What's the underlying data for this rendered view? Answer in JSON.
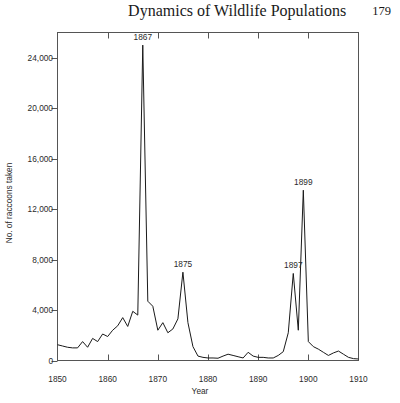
{
  "header": {
    "title": "Dynamics of Wildlife Populations",
    "page_number": "179"
  },
  "chart_data": {
    "type": "line",
    "title": "",
    "xlabel": "Year",
    "ylabel": "No. of raccoons taken",
    "xlim": [
      1850,
      1910
    ],
    "ylim": [
      0,
      26000
    ],
    "grid": false,
    "legend": null,
    "x_ticks": [
      "1850",
      "1860",
      "1870",
      "1880",
      "1890",
      "1900",
      "1910"
    ],
    "x_tick_values": [
      1850,
      1860,
      1870,
      1880,
      1890,
      1900,
      1910
    ],
    "y_ticks": [
      "0",
      "4,000",
      "8,000",
      "12,000",
      "16,000",
      "20,000",
      "24,000"
    ],
    "y_tick_values": [
      0,
      4000,
      8000,
      12000,
      16000,
      20000,
      24000
    ],
    "line_color": "#1a1a1a",
    "annotations": [
      {
        "label": "1867",
        "x": 1867,
        "y": 25000
      },
      {
        "label": "1875",
        "x": 1875,
        "y": 7000
      },
      {
        "label": "1897",
        "x": 1897,
        "y": 6900
      },
      {
        "label": "1899",
        "x": 1899,
        "y": 13500
      }
    ],
    "x": [
      1850,
      1851,
      1852,
      1853,
      1854,
      1855,
      1856,
      1857,
      1858,
      1859,
      1860,
      1861,
      1862,
      1863,
      1864,
      1865,
      1866,
      1867,
      1868,
      1869,
      1870,
      1871,
      1872,
      1873,
      1874,
      1875,
      1876,
      1877,
      1878,
      1879,
      1880,
      1881,
      1882,
      1883,
      1884,
      1885,
      1886,
      1887,
      1888,
      1889,
      1890,
      1891,
      1892,
      1893,
      1894,
      1895,
      1896,
      1897,
      1898,
      1899,
      1900,
      1901,
      1902,
      1903,
      1904,
      1905,
      1906,
      1907,
      1908,
      1909,
      1910
    ],
    "values": [
      1250,
      1150,
      1050,
      1000,
      1000,
      1500,
      1050,
      1750,
      1500,
      2100,
      1900,
      2400,
      2750,
      3400,
      2700,
      3900,
      3600,
      25000,
      4700,
      4300,
      2400,
      3000,
      2200,
      2500,
      3300,
      7000,
      3000,
      1100,
      350,
      250,
      200,
      200,
      180,
      350,
      500,
      400,
      300,
      200,
      650,
      350,
      250,
      250,
      200,
      200,
      400,
      700,
      2200,
      6900,
      2400,
      13500,
      1500,
      1100,
      900,
      650,
      400,
      600,
      750,
      500,
      250,
      150,
      120
    ]
  }
}
